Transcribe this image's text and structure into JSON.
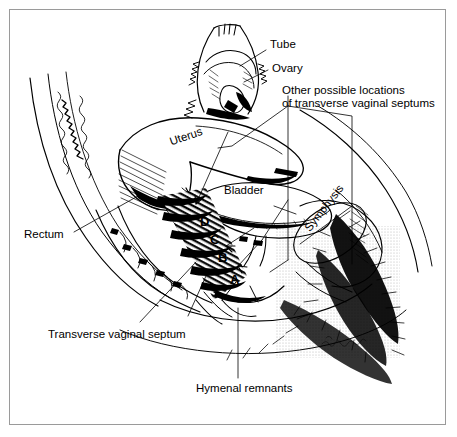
{
  "figure": {
    "kind": "medical-line-drawing",
    "style": "black ink line art on white, hatched/stippled shading",
    "border_color": "#9a9a9a",
    "ink_color": "#000000",
    "background": "#ffffff"
  },
  "labels": {
    "tube": "Tube",
    "ovary": "Ovary",
    "other_locations_line1": "Other possible locations",
    "other_locations_line2": "of transverse vaginal septums",
    "uterus": "Uterus",
    "bladder": "Bladder",
    "symphysis": "Symphysis",
    "rectum": "Rectum",
    "transverse_vaginal_septum": "Transverse vaginal septum",
    "hymenal_remnants": "Hymenal remnants"
  },
  "markers": [
    {
      "id": "D",
      "label": "D",
      "note": "highest septum level, upper vagina"
    },
    {
      "id": "C",
      "label": "C",
      "note": "upper-mid vagina"
    },
    {
      "id": "B",
      "label": "B",
      "note": "mid vagina"
    },
    {
      "id": "A",
      "label": "A",
      "note": "lower vagina near introitus"
    }
  ],
  "structures": [
    "sacrum",
    "rectum",
    "uterus",
    "fallopian tube",
    "ovary",
    "broad ligament",
    "vagina",
    "bladder",
    "symphysis pubis",
    "perineum",
    "pubic hair",
    "hymen"
  ],
  "signature": {
    "present": true,
    "style": "cursive artist signature, illegible"
  }
}
